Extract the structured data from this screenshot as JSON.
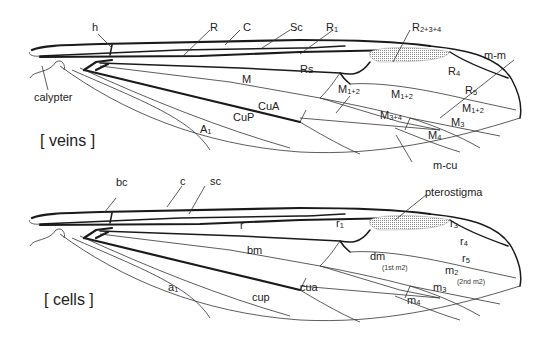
{
  "figure": {
    "panels": [
      {
        "id": "veins",
        "title": "[ veins ]",
        "labels": {
          "h": "h",
          "R": "R",
          "C": "C",
          "Sc": "Sc",
          "R1_base": "R",
          "R1_sub": "1",
          "R234_base": "R",
          "R234_sub": "2+3+4",
          "m_m": "m-m",
          "Rs": "Rs",
          "R4_base": "R",
          "R4_sub": "4",
          "R5_base": "R",
          "R5_sub": "5",
          "M": "M",
          "M12a_base": "M",
          "M12a_sub": "1+2",
          "M12b_base": "M",
          "M12b_sub": "1+2",
          "M12c_base": "M",
          "M12c_sub": "1+2",
          "M3_base": "M",
          "M3_sub": "3",
          "M34_base": "M",
          "M34_sub": "3+4",
          "M4_base": "M",
          "M4_sub": "4",
          "CuA": "CuA",
          "CuP": "CuP",
          "A1_base": "A",
          "A1_sub": "1",
          "m_cu": "m-cu",
          "calypter": "calypter"
        }
      },
      {
        "id": "cells",
        "title": "[ cells ]",
        "labels": {
          "bc": "bc",
          "c": "c",
          "sc": "sc",
          "pterostigma": "pterostigma",
          "r": "r",
          "r1_base": "r",
          "r1_sub": "1",
          "r3_base": "r",
          "r3_sub": "3",
          "r4_base": "r",
          "r4_sub": "4",
          "r5_base": "r",
          "r5_sub": "5",
          "bm": "bm",
          "dm": "dm",
          "dm_note": "(1st m2)",
          "m2_base": "m",
          "m2_sub": "2",
          "m2_note": "(2nd m2)",
          "m3_base": "m",
          "m3_sub": "3",
          "m4_base": "m",
          "m4_sub": "4",
          "a1_base": "a",
          "a1_sub": "1",
          "cup": "cup",
          "cua": "cua"
        }
      }
    ],
    "colors": {
      "vein": "#1a1a1a",
      "stigma": "#9a9a9a",
      "background": "#ffffff"
    }
  }
}
